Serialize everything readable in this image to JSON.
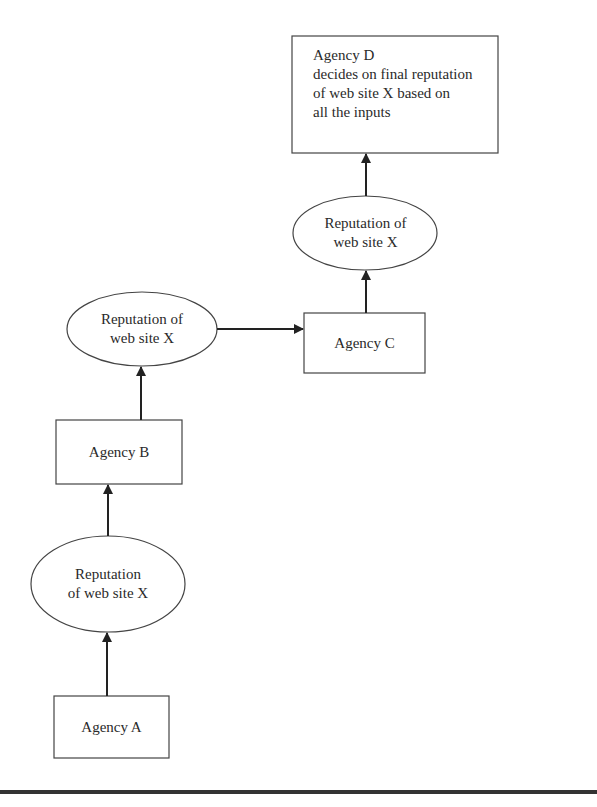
{
  "diagram": {
    "nodes": {
      "agency_d": {
        "title": "Agency D",
        "lines": [
          "decides on final reputation",
          "of web site X based on",
          "all the inputs"
        ]
      },
      "rep_c": {
        "lines": [
          "Reputation of",
          "web site X"
        ]
      },
      "agency_c": {
        "label": "Agency C"
      },
      "rep_b": {
        "lines": [
          "Reputation of",
          "web site X"
        ]
      },
      "agency_b": {
        "label": "Agency B"
      },
      "rep_a": {
        "lines": [
          "Reputation",
          "of web site X"
        ]
      },
      "agency_a": {
        "label": "Agency A"
      }
    },
    "edges": [
      {
        "from": "agency_a",
        "to": "rep_a"
      },
      {
        "from": "rep_a",
        "to": "agency_b"
      },
      {
        "from": "agency_b",
        "to": "rep_b"
      },
      {
        "from": "rep_b",
        "to": "agency_c"
      },
      {
        "from": "agency_c",
        "to": "rep_c"
      },
      {
        "from": "rep_c",
        "to": "agency_d"
      }
    ],
    "colors": {
      "stroke": "#333333",
      "text": "#2a2a2a",
      "background": "#ffffff"
    }
  }
}
